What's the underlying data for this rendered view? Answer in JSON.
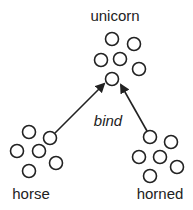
{
  "labels": {
    "top": "unicorn",
    "left": "horse",
    "right": "horned",
    "relation": "bind"
  },
  "groups": {
    "unicorn": {
      "circles": [
        [
          112,
          39
        ],
        [
          134,
          44
        ],
        [
          101,
          60
        ],
        [
          120,
          59
        ],
        [
          139,
          69
        ],
        [
          112,
          79
        ]
      ]
    },
    "horse": {
      "circles": [
        [
          29,
          132
        ],
        [
          50,
          138
        ],
        [
          17,
          151
        ],
        [
          39,
          151
        ],
        [
          56,
          163
        ],
        [
          29,
          171
        ]
      ]
    },
    "horned": {
      "circles": [
        [
          150,
          137
        ],
        [
          171,
          142
        ],
        [
          139,
          157
        ],
        [
          160,
          157
        ],
        [
          177,
          167
        ],
        [
          150,
          176
        ]
      ]
    }
  },
  "arrows": [
    {
      "from": "horse",
      "to": "unicorn"
    },
    {
      "from": "horned",
      "to": "unicorn"
    }
  ],
  "colors": {
    "stroke": "#222222",
    "background": "#ffffff"
  }
}
